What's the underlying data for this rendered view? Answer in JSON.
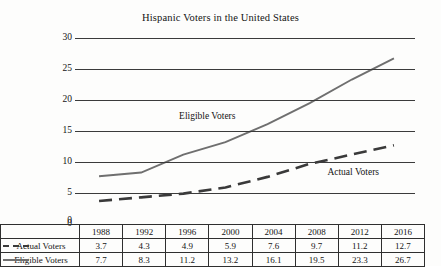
{
  "chart_data": {
    "type": "line",
    "title": "Hispanic Voters in the United States",
    "xlabel": "",
    "ylabel": "",
    "ylim": [
      0,
      30
    ],
    "yticks": [
      0,
      5,
      10,
      15,
      20,
      25,
      30
    ],
    "grid": true,
    "legend_position": "table-row-labels",
    "categories": [
      "1988",
      "1992",
      "1996",
      "2000",
      "2004",
      "2008",
      "2012",
      "2016"
    ],
    "series": [
      {
        "name": "Actual Voters",
        "style": "dashed",
        "color": "#3a3a3a",
        "values": [
          3.7,
          4.3,
          4.9,
          5.9,
          7.6,
          9.7,
          11.2,
          12.7
        ]
      },
      {
        "name": "Eligible Voters",
        "style": "solid",
        "color": "#6f6f6f",
        "values": [
          7.7,
          8.3,
          11.2,
          13.2,
          16.1,
          19.5,
          23.3,
          26.7
        ]
      }
    ],
    "annotations": [
      {
        "text": "Eligible Voters",
        "x_frac": 0.3,
        "y_value": 17.3
      },
      {
        "text": "Actual Voters",
        "x_frac": 0.74,
        "y_value": 8.2
      }
    ]
  },
  "table": {
    "header_row_blank": "",
    "years": [
      "1988",
      "1992",
      "1996",
      "2000",
      "2004",
      "2008",
      "2012",
      "2016"
    ],
    "rows": [
      {
        "label": "Actual Voters",
        "marker": "dashed-line-icon",
        "values": [
          "3.7",
          "4.3",
          "4.9",
          "5.9",
          "7.6",
          "9.7",
          "11.2",
          "12.7"
        ]
      },
      {
        "label": "Eligible Voters",
        "marker": "solid-line-icon",
        "values": [
          "7.7",
          "8.3",
          "11.2",
          "13.2",
          "16.1",
          "19.5",
          "23.3",
          "26.7"
        ]
      }
    ]
  },
  "axis": {
    "y_labels": [
      "30",
      "25",
      "20",
      "15",
      "10",
      "5",
      "0"
    ]
  }
}
